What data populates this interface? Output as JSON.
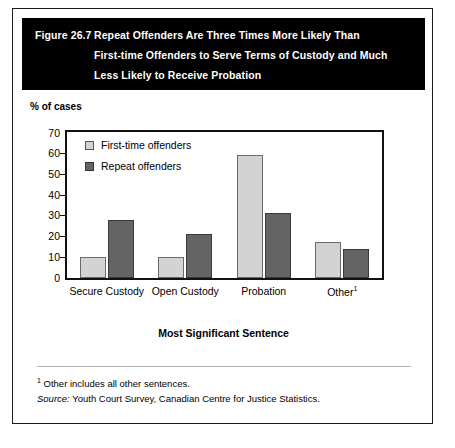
{
  "figure": {
    "number": "Figure 26.7",
    "title_lines": [
      "Repeat Offenders Are Three Times More Likely Than",
      "First-time Offenders to Serve Terms of Custody and Much",
      "Less Likely to Receive Probation"
    ]
  },
  "footer": {
    "footnote_marker": "1",
    "footnote_text": " Other includes all other sentences.",
    "source_label": "Source:",
    "source_text": " Youth Court Survey, Canadian Centre for Justice Statistics."
  },
  "colors": {
    "first_time": "#d3d3d3",
    "repeat": "#646464",
    "banner": "#000000",
    "axis": "#111111",
    "footer_rule": "#b4b4b4"
  },
  "chart_data": {
    "type": "bar",
    "title": "Repeat Offenders Are Three Times More Likely Than First-time Offenders to Serve Terms of Custody and Much Less Likely to Receive Probation",
    "categories": [
      "Secure Custody",
      "Open Custody",
      "Probation",
      "Other"
    ],
    "category_superscripts": [
      "",
      "",
      "",
      "1"
    ],
    "series": [
      {
        "name": "First-time offenders",
        "values": [
          10,
          10,
          59,
          17
        ],
        "color": "#d3d3d3"
      },
      {
        "name": "Repeat offenders",
        "values": [
          28,
          21,
          31,
          14
        ],
        "color": "#646464"
      }
    ],
    "xlabel": "Most Significant Sentence",
    "ylabel": "% of cases",
    "ylim": [
      0,
      70
    ],
    "yticks": [
      0,
      10,
      20,
      30,
      40,
      50,
      60,
      70
    ],
    "ytick_labels": [
      "0",
      "10",
      "20",
      "30",
      "40",
      "50",
      "60",
      "70"
    ],
    "grid": false,
    "legend_position": "inside-top-left"
  }
}
